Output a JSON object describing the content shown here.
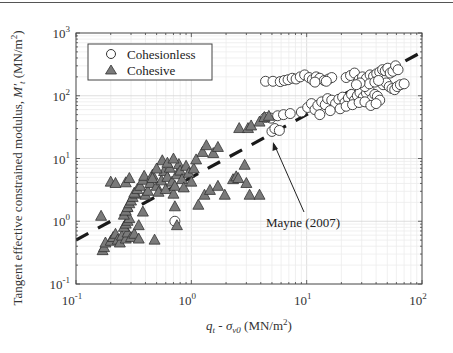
{
  "chart_data": {
    "type": "scatter",
    "title": "",
    "xlabel": "q_t - σ_v0 (MN/m²)",
    "xlabel_parts": {
      "q": "q",
      "q_sub": "t",
      "dash": " - ",
      "sigma": "σ",
      "sigma_sub": "v0",
      "units": " (MN/m",
      "units_sup": "2",
      "units_close": ")"
    },
    "ylabel": "Tangent effective constrained modulus, M'_t (MN/m²)",
    "ylabel_parts": {
      "main": "Tangent effective constrained modulus, ",
      "M": "M'",
      "M_sub": "t",
      "units": " (MN/m",
      "units_sup": "2",
      "units_close": ")"
    },
    "xscale": "log",
    "yscale": "log",
    "xlim": [
      0.1,
      100
    ],
    "ylim": [
      0.1,
      1000
    ],
    "xticks": [
      {
        "base": "10",
        "exp": "-1",
        "value": 0.1
      },
      {
        "base": "10",
        "exp": "0",
        "value": 1
      },
      {
        "base": "10",
        "exp": "1",
        "value": 10
      },
      {
        "base": "10",
        "exp": "2",
        "value": 100
      }
    ],
    "yticks": [
      {
        "base": "10",
        "exp": "-1",
        "value": 0.1
      },
      {
        "base": "10",
        "exp": "0",
        "value": 1
      },
      {
        "base": "10",
        "exp": "1",
        "value": 10
      },
      {
        "base": "10",
        "exp": "2",
        "value": 100
      },
      {
        "base": "10",
        "exp": "3",
        "value": 1000
      }
    ],
    "grid": true,
    "legend_position": "upper left",
    "legend": [
      {
        "label": "Cohesionless",
        "marker": "circle"
      },
      {
        "label": "Cohesive",
        "marker": "triangle"
      }
    ],
    "series": [
      {
        "name": "Cohesionless",
        "marker": "circle",
        "facecolor": "#ffffff",
        "edgecolor": "#333333",
        "points": [
          [
            0.72,
            1.0
          ],
          [
            5.0,
            27
          ],
          [
            5.3,
            30
          ],
          [
            5.8,
            28
          ],
          [
            4.4,
            45
          ],
          [
            4.9,
            44
          ],
          [
            5.6,
            48
          ],
          [
            6.3,
            50
          ],
          [
            7.2,
            52
          ],
          [
            4.4,
            170
          ],
          [
            5.1,
            170
          ],
          [
            5.9,
            168
          ],
          [
            6.4,
            175
          ],
          [
            6.9,
            180
          ],
          [
            7.5,
            190
          ],
          [
            8.1,
            185
          ],
          [
            8.8,
            200
          ],
          [
            9.6,
            215
          ],
          [
            10.5,
            195
          ],
          [
            11.2,
            180
          ],
          [
            12.1,
            200
          ],
          [
            13.0,
            190
          ],
          [
            14.2,
            175
          ],
          [
            15.5,
            185
          ],
          [
            16.5,
            195
          ],
          [
            11.8,
            165
          ],
          [
            14.8,
            170
          ],
          [
            9.0,
            55
          ],
          [
            10.2,
            65
          ],
          [
            11.0,
            75
          ],
          [
            11.8,
            60
          ],
          [
            12.5,
            70
          ],
          [
            13.5,
            80
          ],
          [
            14.5,
            72
          ],
          [
            15.2,
            90
          ],
          [
            16.5,
            85
          ],
          [
            17.8,
            75
          ],
          [
            19.0,
            88
          ],
          [
            20.5,
            95
          ],
          [
            21.5,
            78
          ],
          [
            23.0,
            92
          ],
          [
            24.5,
            105
          ],
          [
            26.0,
            85
          ],
          [
            27.5,
            100
          ],
          [
            29.0,
            112
          ],
          [
            31.0,
            95
          ],
          [
            33.0,
            110
          ],
          [
            35.0,
            120
          ],
          [
            37.0,
            90
          ],
          [
            39.0,
            105
          ],
          [
            41.0,
            98
          ],
          [
            43.0,
            85
          ],
          [
            13.0,
            50
          ],
          [
            16.0,
            58
          ],
          [
            19.5,
            62
          ],
          [
            22.0,
            68
          ],
          [
            25.0,
            72
          ],
          [
            28.5,
            78
          ],
          [
            32.0,
            80
          ],
          [
            36.0,
            70
          ],
          [
            40.0,
            75
          ],
          [
            22.0,
            195
          ],
          [
            24.0,
            210
          ],
          [
            26.0,
            230
          ],
          [
            28.5,
            180
          ],
          [
            30.5,
            200
          ],
          [
            33.0,
            190
          ],
          [
            35.5,
            215
          ],
          [
            38.0,
            205
          ],
          [
            40.5,
            225
          ],
          [
            43.0,
            240
          ],
          [
            45.5,
            260
          ],
          [
            48.0,
            250
          ],
          [
            50.5,
            275
          ],
          [
            53.0,
            230
          ],
          [
            56.0,
            245
          ],
          [
            59.0,
            300
          ],
          [
            62.0,
            260
          ],
          [
            46.0,
            150
          ],
          [
            49.0,
            160
          ],
          [
            52.0,
            140
          ],
          [
            55.0,
            130
          ],
          [
            58.0,
            125
          ],
          [
            61.0,
            140
          ],
          [
            65.0,
            150
          ],
          [
            70.0,
            155
          ],
          [
            32.0,
            140
          ],
          [
            35.0,
            155
          ],
          [
            39.0,
            165
          ],
          [
            42.0,
            175
          ],
          [
            29.0,
            160
          ],
          [
            27.0,
            150
          ]
        ]
      },
      {
        "name": "Cohesive",
        "marker": "triangle",
        "facecolor": "#7a7a7a",
        "edgecolor": "#333333",
        "points": [
          [
            0.17,
            0.34
          ],
          [
            0.175,
            0.38
          ],
          [
            0.18,
            0.45
          ],
          [
            0.165,
            1.2
          ],
          [
            0.2,
            0.48
          ],
          [
            0.21,
            0.55
          ],
          [
            0.22,
            0.62
          ],
          [
            0.23,
            0.5
          ],
          [
            0.24,
            0.45
          ],
          [
            0.25,
            0.58
          ],
          [
            0.27,
            0.52
          ],
          [
            0.28,
            0.65
          ],
          [
            0.3,
            0.55
          ],
          [
            0.32,
            0.62
          ],
          [
            0.35,
            0.52
          ],
          [
            0.48,
            0.5
          ],
          [
            0.26,
            0.8
          ],
          [
            0.27,
            0.9
          ],
          [
            0.28,
            1.0
          ],
          [
            0.29,
            1.1
          ],
          [
            0.26,
            1.25
          ],
          [
            0.27,
            1.45
          ],
          [
            0.28,
            1.65
          ],
          [
            0.29,
            1.9
          ],
          [
            0.3,
            2.1
          ],
          [
            0.31,
            2.4
          ],
          [
            0.33,
            2.7
          ],
          [
            0.35,
            0.85
          ],
          [
            0.38,
            1.4
          ],
          [
            0.2,
            4.2
          ],
          [
            0.22,
            4.0
          ],
          [
            0.27,
            4.1
          ],
          [
            0.29,
            4.8
          ],
          [
            0.32,
            2.8
          ],
          [
            0.34,
            3.2
          ],
          [
            0.36,
            3.6
          ],
          [
            0.38,
            4.5
          ],
          [
            0.39,
            5.2
          ],
          [
            0.4,
            2.6
          ],
          [
            0.42,
            3.0
          ],
          [
            0.44,
            4.0
          ],
          [
            0.46,
            5.4
          ],
          [
            0.5,
            3.6
          ],
          [
            0.52,
            2.9
          ],
          [
            0.55,
            4.4
          ],
          [
            0.58,
            6.2
          ],
          [
            0.6,
            3.2
          ],
          [
            0.62,
            5.0
          ],
          [
            0.65,
            7.0
          ],
          [
            0.68,
            4.2
          ],
          [
            0.7,
            2.7
          ],
          [
            0.72,
            3.6
          ],
          [
            0.75,
            5.5
          ],
          [
            0.78,
            8.0
          ],
          [
            0.8,
            6.3
          ],
          [
            0.83,
            4.6
          ],
          [
            0.86,
            3.4
          ],
          [
            0.9,
            7.5
          ],
          [
            0.95,
            5.8
          ],
          [
            1.0,
            4.2
          ],
          [
            1.05,
            6.8
          ],
          [
            0.56,
            9.2
          ],
          [
            0.62,
            8.4
          ],
          [
            0.7,
            9.8
          ],
          [
            0.5,
            6.8
          ],
          [
            0.46,
            4.8
          ],
          [
            0.72,
            1.7
          ],
          [
            0.75,
            0.85
          ],
          [
            1.15,
            1.8
          ],
          [
            1.1,
            9.5
          ],
          [
            1.25,
            12.5
          ],
          [
            1.35,
            16
          ],
          [
            1.55,
            12
          ],
          [
            1.7,
            15
          ],
          [
            2.6,
            30
          ],
          [
            3.1,
            30
          ],
          [
            3.3,
            33
          ],
          [
            3.9,
            38
          ],
          [
            4.3,
            45
          ],
          [
            4.7,
            47
          ],
          [
            1.3,
            2.6
          ],
          [
            1.45,
            3.1
          ],
          [
            1.7,
            3.6
          ],
          [
            1.95,
            2.6
          ],
          [
            2.3,
            4.6
          ],
          [
            2.45,
            5.1
          ],
          [
            2.55,
            4.8
          ],
          [
            2.9,
            7.8
          ],
          [
            3.0,
            4.0
          ],
          [
            3.2,
            2.6
          ],
          [
            3.9,
            2.6
          ]
        ]
      }
    ],
    "reference_line": {
      "name": "Mayne (2007)",
      "style": "dashed",
      "color": "#1a1a1a",
      "points": [
        [
          0.1,
          0.5
        ],
        [
          100,
          500
        ]
      ]
    },
    "annotations": [
      {
        "text": "Mayne (2007)",
        "x": 8.5,
        "y": 0.7,
        "arrow_to": [
          5.0,
          20.0
        ]
      }
    ]
  }
}
